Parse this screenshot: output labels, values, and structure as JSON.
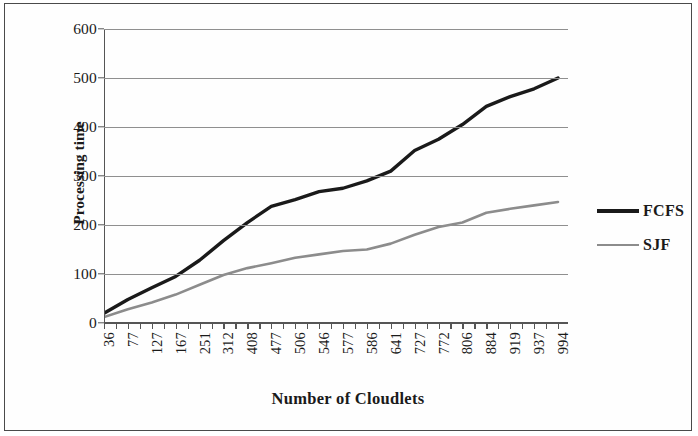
{
  "chart_data": {
    "type": "line",
    "title": "",
    "xlabel": "Number of Cloudlets",
    "ylabel": "Processing time",
    "categories": [
      "36",
      "77",
      "127",
      "167",
      "251",
      "312",
      "408",
      "477",
      "506",
      "546",
      "577",
      "586",
      "641",
      "727",
      "772",
      "806",
      "884",
      "919",
      "937",
      "994"
    ],
    "xtick_labels": [
      "36",
      "77",
      "127",
      "167",
      "251",
      "312",
      "408",
      "477",
      "506",
      "546",
      "577",
      "586",
      "641",
      "727",
      "772",
      "806",
      "884",
      "919",
      "937",
      "994"
    ],
    "ytick_labels": [
      "0",
      "100",
      "200",
      "300",
      "400",
      "500",
      "600"
    ],
    "yticks": [
      0,
      100,
      200,
      300,
      400,
      500,
      600
    ],
    "ylim": [
      0,
      600
    ],
    "grid": "horizontal",
    "legend_position": "right",
    "series": [
      {
        "name": "FCFS",
        "color": "#1a1a1a",
        "line_width": 3.4,
        "values": [
          20,
          48,
          72,
          95,
          128,
          168,
          205,
          238,
          252,
          268,
          275,
          290,
          310,
          352,
          375,
          405,
          442,
          462,
          478,
          500
        ]
      },
      {
        "name": "SJF",
        "color": "#8c8c8c",
        "line_width": 2.6,
        "values": [
          12,
          28,
          42,
          58,
          78,
          98,
          112,
          122,
          133,
          140,
          147,
          150,
          162,
          180,
          196,
          205,
          225,
          233,
          240,
          247
        ]
      }
    ]
  },
  "legend": {
    "items": [
      {
        "label": "FCFS"
      },
      {
        "label": "SJF"
      }
    ]
  },
  "axes": {
    "y_title": "Processing time",
    "x_title": "Number of Cloudlets"
  }
}
